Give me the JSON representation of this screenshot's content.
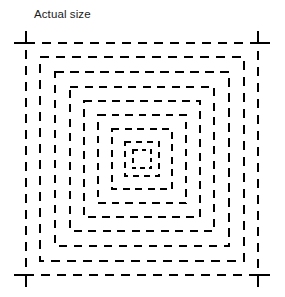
{
  "figure": {
    "caption": "Actual size",
    "caption_position": {
      "x": 34,
      "y": 7
    },
    "background_color": "#ffffff",
    "stroke_color": "#000000",
    "canvas": {
      "width": 285,
      "height": 297
    }
  },
  "diagram": {
    "type": "concentric-dashed-squares",
    "center": {
      "x": 142,
      "y": 159
    },
    "square_count": 9,
    "corner_style": "crosshair-overshoot-on-outermost",
    "corner_overshoot_px": 12,
    "squares": [
      {
        "index": 1,
        "label": "outermost",
        "half_size": 116,
        "stroke_width": 2.6,
        "dash": 9,
        "gap": 7,
        "crosshair": true
      },
      {
        "index": 2,
        "label": "ring-2",
        "half_size": 102,
        "stroke_width": 2.6,
        "dash": 9,
        "gap": 7,
        "crosshair": false
      },
      {
        "index": 3,
        "label": "ring-3",
        "half_size": 87,
        "stroke_width": 2.5,
        "dash": 8.5,
        "gap": 6.5,
        "crosshair": false
      },
      {
        "index": 4,
        "label": "ring-4",
        "half_size": 72,
        "stroke_width": 2.5,
        "dash": 8,
        "gap": 6.5,
        "crosshair": false
      },
      {
        "index": 5,
        "label": "ring-5",
        "half_size": 58,
        "stroke_width": 2.4,
        "dash": 8,
        "gap": 6,
        "crosshair": false
      },
      {
        "index": 6,
        "label": "ring-6",
        "half_size": 44,
        "stroke_width": 2.3,
        "dash": 7.5,
        "gap": 6,
        "crosshair": false
      },
      {
        "index": 7,
        "label": "ring-7",
        "half_size": 30,
        "stroke_width": 2.2,
        "dash": 7,
        "gap": 5.5,
        "crosshair": false
      },
      {
        "index": 8,
        "label": "ring-8",
        "half_size": 17,
        "stroke_width": 2.0,
        "dash": 6,
        "gap": 5,
        "crosshair": false
      },
      {
        "index": 9,
        "label": "innermost",
        "half_size": 9,
        "stroke_width": 1.7,
        "dash": 4.5,
        "gap": 4,
        "crosshair": false
      }
    ]
  }
}
